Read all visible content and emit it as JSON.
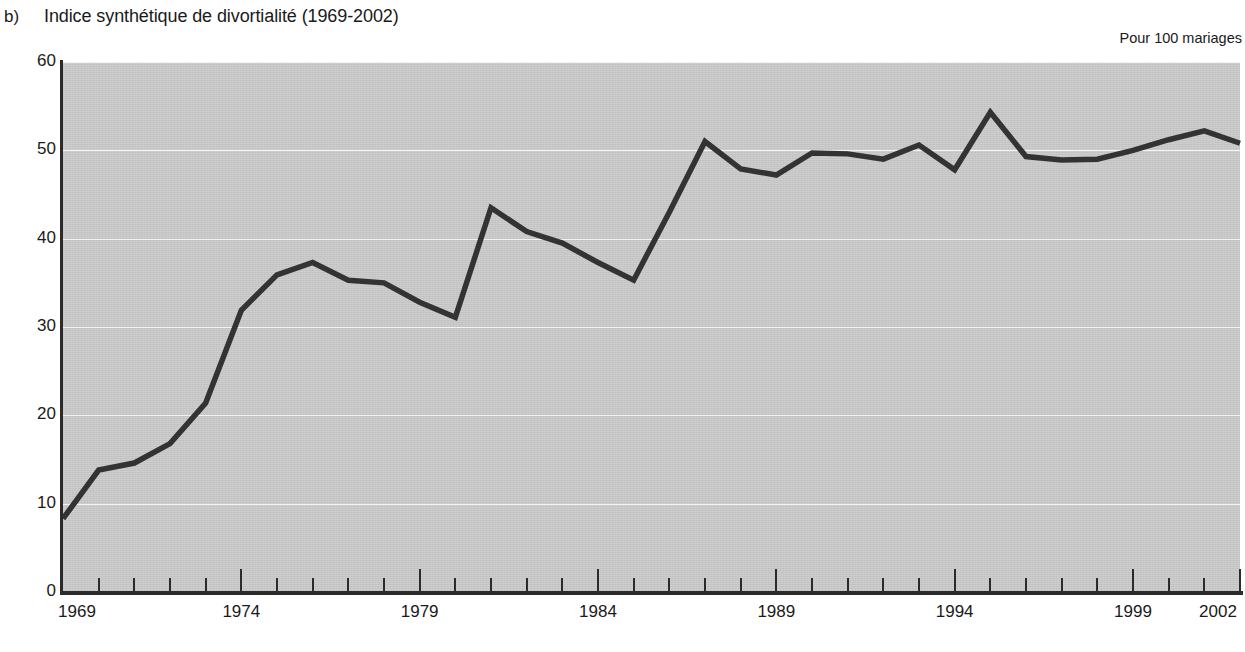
{
  "header": {
    "panel_letter": "b)",
    "title": "Indice synthétique de divortialité (1969-2002)",
    "unit_label": "Pour 100 mariages"
  },
  "colors": {
    "plot_background": "#c5c5c5",
    "gridline": "#f3f3f3",
    "axis": "#2b2b2b",
    "series_line": "#333333",
    "page_background": "#ffffff",
    "text": "#1a1a1a"
  },
  "chart_data": {
    "type": "line",
    "title": "Indice synthétique de divortialité (1969-2002)",
    "xlabel": "",
    "ylabel": "Pour 100 mariages",
    "xlim": [
      1969,
      2002
    ],
    "ylim": [
      0,
      60
    ],
    "grid": true,
    "legend": false,
    "y_ticks": [
      0,
      10,
      20,
      30,
      40,
      50,
      60
    ],
    "y_tick_labels": [
      "0",
      "10",
      "20",
      "30",
      "40",
      "50",
      "60"
    ],
    "x_tick_labels": [
      "1969",
      "1974",
      "1979",
      "1984",
      "1989",
      "1994",
      "1999",
      "2002"
    ],
    "x_major_ticks": [
      1969,
      1974,
      1979,
      1984,
      1989,
      1994,
      1999,
      2002
    ],
    "x_minor_tick_step": 1,
    "series": [
      {
        "name": "Indice synthétique de divortialité",
        "x": [
          1969,
          1970,
          1971,
          1972,
          1973,
          1974,
          1975,
          1976,
          1977,
          1978,
          1979,
          1980,
          1981,
          1982,
          1983,
          1984,
          1985,
          1986,
          1987,
          1988,
          1989,
          1990,
          1991,
          1992,
          1993,
          1994,
          1995,
          1996,
          1997,
          1998,
          1999,
          2000,
          2001,
          2002
        ],
        "values": [
          8.3,
          13.8,
          14.6,
          16.8,
          21.4,
          31.9,
          35.9,
          37.3,
          35.3,
          35.0,
          32.8,
          31.1,
          43.5,
          40.8,
          39.5,
          37.3,
          35.3,
          43.0,
          51.0,
          47.9,
          47.2,
          49.7,
          49.6,
          49.0,
          50.6,
          47.8,
          54.3,
          49.3,
          48.9,
          49.0,
          50.0,
          51.2,
          52.2,
          50.8
        ]
      }
    ]
  }
}
